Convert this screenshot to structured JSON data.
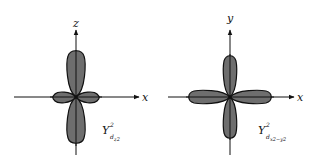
{
  "figures": [
    {
      "id": "dz2",
      "axes": {
        "horizontal": "x",
        "vertical": "z"
      },
      "label": {
        "main": "Y",
        "sup": "2",
        "sub": "d",
        "subsub": "z2"
      },
      "shape": "two large lobes along z, small torus-like lobes along x"
    },
    {
      "id": "dx2-y2",
      "axes": {
        "horizontal": "x",
        "vertical": "y"
      },
      "label": {
        "main": "Y",
        "sup": "2",
        "sub": "d",
        "subsub": "x2−y2"
      },
      "shape": "four equal lobes along x and y axes"
    }
  ],
  "colors": {
    "lobe_fill": "#6e6e6e",
    "outline": "#111111",
    "background": "#ffffff"
  }
}
